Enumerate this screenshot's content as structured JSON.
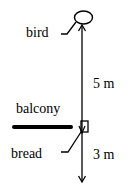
{
  "diagram": {
    "labels": {
      "bird": "bird",
      "balcony": "balcony",
      "bread": "bread",
      "distance_bird_to_balcony": "5 m",
      "distance_balcony_to_ground": "3 m"
    },
    "colors": {
      "ink": "#000000",
      "background": "#ffffff"
    }
  }
}
